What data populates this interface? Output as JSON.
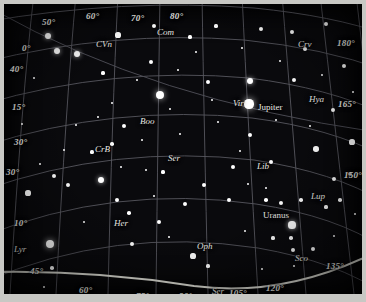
{
  "chart_data": {
    "type": "scatter",
    "xlabel": "Azimuth (degrees)",
    "ylabel": "Altitude (degrees)",
    "grid": true,
    "legend": "none",
    "azimuth_labels": [
      "50°",
      "60°",
      "70°",
      "80°",
      "180°",
      "165°",
      "150°",
      "135°",
      "120°",
      "105°",
      "90°",
      "75°",
      "60°",
      "45°"
    ],
    "altitude_labels": [
      "0°",
      "40°",
      "15°",
      "30°",
      "30°",
      "10°"
    ],
    "constellations": [
      "CVn",
      "Com",
      "Crv",
      "Vir",
      "Hya",
      "Boo",
      "CrB",
      "Ser",
      "Lib",
      "Lup",
      "Her",
      "Oph",
      "Sco",
      "Ser",
      "Lyr"
    ],
    "planets": [
      "Jupiter",
      "Uranus"
    ],
    "background_color": "#0a0a0d",
    "grid_color": "#5a5a62",
    "star_color": "#ffffff",
    "horizon_color": "#d8d8d0"
  },
  "labels": {
    "coords_top": [
      {
        "text": "50°",
        "x": 38,
        "y": 14
      },
      {
        "text": "60°",
        "x": 82,
        "y": 8
      },
      {
        "text": "70°",
        "x": 127,
        "y": 10
      },
      {
        "text": "80°",
        "x": 166,
        "y": 8
      }
    ],
    "coords_left": [
      {
        "text": "0°",
        "x": 18,
        "y": 40
      },
      {
        "text": "40°",
        "x": 6,
        "y": 61
      },
      {
        "text": "15°",
        "x": 8,
        "y": 99
      },
      {
        "text": "30°",
        "x": 10,
        "y": 134
      },
      {
        "text": "30°",
        "x": 2,
        "y": 164
      },
      {
        "text": "10°",
        "x": 10,
        "y": 215
      },
      {
        "text": "45°",
        "x": 26,
        "y": 263
      }
    ],
    "coords_right": [
      {
        "text": "180°",
        "x": 333,
        "y": 35
      },
      {
        "text": "165°",
        "x": 334,
        "y": 96
      },
      {
        "text": "150°",
        "x": 340,
        "y": 167
      }
    ],
    "coords_bottom": [
      {
        "text": "60°",
        "x": 75,
        "y": 282
      },
      {
        "text": "75°",
        "x": 132,
        "y": 288
      },
      {
        "text": "90°",
        "x": 175,
        "y": 288
      },
      {
        "text": "105°",
        "x": 225,
        "y": 285
      },
      {
        "text": "120°",
        "x": 262,
        "y": 280
      },
      {
        "text": "135°",
        "x": 322,
        "y": 258
      }
    ],
    "constellations": [
      {
        "text": "CVn",
        "x": 92,
        "y": 36
      },
      {
        "text": "Com",
        "x": 153,
        "y": 24
      },
      {
        "text": "Crv",
        "x": 294,
        "y": 36
      },
      {
        "text": "Vir",
        "x": 229,
        "y": 95
      },
      {
        "text": "Hya",
        "x": 305,
        "y": 91
      },
      {
        "text": "Boo",
        "x": 136,
        "y": 113
      },
      {
        "text": "CrB",
        "x": 91,
        "y": 141
      },
      {
        "text": "Ser",
        "x": 164,
        "y": 150
      },
      {
        "text": "Lib",
        "x": 253,
        "y": 158
      },
      {
        "text": "Lup",
        "x": 307,
        "y": 188
      },
      {
        "text": "Her",
        "x": 110,
        "y": 215
      },
      {
        "text": "Oph",
        "x": 193,
        "y": 238
      },
      {
        "text": "Sco",
        "x": 291,
        "y": 250
      },
      {
        "text": "Ser",
        "x": 208,
        "y": 283
      },
      {
        "text": "Lyr",
        "x": 10,
        "y": 241
      }
    ],
    "planets": [
      {
        "text": "Jupiter",
        "x": 254,
        "y": 99
      },
      {
        "text": "Uranus",
        "x": 259,
        "y": 207
      }
    ]
  },
  "stars": [
    {
      "x": 44,
      "y": 32,
      "r": 3.2
    },
    {
      "x": 53,
      "y": 47,
      "r": 3.0
    },
    {
      "x": 73,
      "y": 50,
      "r": 3.3
    },
    {
      "x": 114,
      "y": 31,
      "r": 2.6
    },
    {
      "x": 150,
      "y": 22,
      "r": 2.0
    },
    {
      "x": 147,
      "y": 58,
      "r": 2.2
    },
    {
      "x": 156,
      "y": 91,
      "r": 4.2
    },
    {
      "x": 186,
      "y": 33,
      "r": 1.6
    },
    {
      "x": 204,
      "y": 78,
      "r": 2.0
    },
    {
      "x": 192,
      "y": 48,
      "r": 1.4
    },
    {
      "x": 212,
      "y": 22,
      "r": 1.6
    },
    {
      "x": 245,
      "y": 100,
      "r": 4.6
    },
    {
      "x": 246,
      "y": 77,
      "r": 3.0
    },
    {
      "x": 246,
      "y": 131,
      "r": 2.4
    },
    {
      "x": 257,
      "y": 25,
      "r": 2.2
    },
    {
      "x": 288,
      "y": 28,
      "r": 2.0
    },
    {
      "x": 301,
      "y": 45,
      "r": 2.0
    },
    {
      "x": 322,
      "y": 20,
      "r": 2.2
    },
    {
      "x": 290,
      "y": 76,
      "r": 2.0
    },
    {
      "x": 329,
      "y": 106,
      "r": 2.2
    },
    {
      "x": 340,
      "y": 62,
      "r": 2.2
    },
    {
      "x": 348,
      "y": 138,
      "r": 2.6
    },
    {
      "x": 312,
      "y": 145,
      "r": 2.8
    },
    {
      "x": 267,
      "y": 158,
      "r": 2.2
    },
    {
      "x": 330,
      "y": 175,
      "r": 2.0
    },
    {
      "x": 346,
      "y": 170,
      "r": 2.0
    },
    {
      "x": 297,
      "y": 196,
      "x2": 0,
      "r": 1.8
    },
    {
      "x": 336,
      "y": 196,
      "r": 1.8
    },
    {
      "x": 322,
      "y": 203,
      "r": 1.6
    },
    {
      "x": 277,
      "y": 199,
      "r": 2.4
    },
    {
      "x": 262,
      "y": 196,
      "r": 1.8
    },
    {
      "x": 288,
      "y": 221,
      "r": 3.6
    },
    {
      "x": 287,
      "y": 234,
      "r": 1.8
    },
    {
      "x": 289,
      "y": 246,
      "r": 2.2
    },
    {
      "x": 309,
      "y": 245,
      "r": 2.0
    },
    {
      "x": 290,
      "y": 262,
      "r": 1.4
    },
    {
      "x": 269,
      "y": 234,
      "r": 1.6
    },
    {
      "x": 225,
      "y": 196,
      "r": 2.4
    },
    {
      "x": 229,
      "y": 163,
      "r": 2.0
    },
    {
      "x": 200,
      "y": 181,
      "r": 2.0
    },
    {
      "x": 181,
      "y": 200,
      "r": 2.0
    },
    {
      "x": 189,
      "y": 252,
      "r": 2.6
    },
    {
      "x": 204,
      "y": 262,
      "r": 1.6
    },
    {
      "x": 155,
      "y": 218,
      "r": 2.2
    },
    {
      "x": 128,
      "y": 240,
      "r": 2.4
    },
    {
      "x": 125,
      "y": 209,
      "r": 1.8
    },
    {
      "x": 113,
      "y": 196,
      "r": 2.0
    },
    {
      "x": 97,
      "y": 176,
      "r": 3.2
    },
    {
      "x": 64,
      "y": 181,
      "r": 2.4
    },
    {
      "x": 50,
      "y": 172,
      "r": 2.2
    },
    {
      "x": 24,
      "y": 189,
      "r": 2.6
    },
    {
      "x": 46,
      "y": 240,
      "r": 4.0
    },
    {
      "x": 48,
      "y": 264,
      "r": 1.8
    },
    {
      "x": 40,
      "y": 283,
      "r": 1.4
    },
    {
      "x": 88,
      "y": 148,
      "r": 1.6
    },
    {
      "x": 108,
      "y": 140,
      "r": 1.8
    },
    {
      "x": 120,
      "y": 122,
      "r": 2.0
    },
    {
      "x": 138,
      "y": 136,
      "r": 1.4
    },
    {
      "x": 159,
      "y": 168,
      "r": 1.6
    },
    {
      "x": 176,
      "y": 130,
      "r": 1.4
    },
    {
      "x": 108,
      "y": 99,
      "r": 1.4
    },
    {
      "x": 94,
      "y": 113,
      "r": 1.4
    },
    {
      "x": 72,
      "y": 121,
      "r": 1.4
    },
    {
      "x": 18,
      "y": 120,
      "r": 1.4
    },
    {
      "x": 30,
      "y": 74,
      "r": 1.4
    },
    {
      "x": 99,
      "y": 69,
      "r": 1.6
    },
    {
      "x": 133,
      "y": 76,
      "r": 1.4
    },
    {
      "x": 166,
      "y": 105,
      "r": 1.4
    },
    {
      "x": 214,
      "y": 118,
      "r": 1.4
    },
    {
      "x": 236,
      "y": 147,
      "r": 1.4
    },
    {
      "x": 272,
      "y": 116,
      "r": 1.4
    },
    {
      "x": 306,
      "y": 122,
      "r": 1.4
    },
    {
      "x": 276,
      "y": 57,
      "r": 1.4
    },
    {
      "x": 238,
      "y": 44,
      "r": 1.4
    },
    {
      "x": 208,
      "y": 96,
      "r": 1.4
    },
    {
      "x": 174,
      "y": 66,
      "r": 1.4
    },
    {
      "x": 142,
      "y": 166,
      "r": 1.4
    },
    {
      "x": 117,
      "y": 163,
      "r": 1.4
    },
    {
      "x": 60,
      "y": 146,
      "r": 1.4
    },
    {
      "x": 36,
      "y": 160,
      "r": 1.4
    },
    {
      "x": 80,
      "y": 218,
      "r": 1.4
    },
    {
      "x": 150,
      "y": 192,
      "r": 1.4
    },
    {
      "x": 165,
      "y": 233,
      "r": 1.4
    },
    {
      "x": 241,
      "y": 227,
      "r": 1.4
    },
    {
      "x": 258,
      "y": 265,
      "r": 1.4
    },
    {
      "x": 330,
      "y": 232,
      "r": 1.4
    },
    {
      "x": 351,
      "y": 210,
      "r": 1.4
    },
    {
      "x": 349,
      "y": 88,
      "r": 1.4
    },
    {
      "x": 318,
      "y": 71,
      "r": 1.4
    },
    {
      "x": 262,
      "y": 184,
      "r": 1.4
    },
    {
      "x": 244,
      "y": 180,
      "r": 1.4
    }
  ]
}
